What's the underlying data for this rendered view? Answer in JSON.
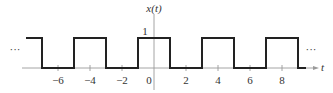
{
  "chart_data": {
    "type": "line",
    "title": "",
    "ylabel": "x(t)",
    "xlabel": "t",
    "xlim": [
      -8.0,
      10.0
    ],
    "ylim": [
      0,
      1
    ],
    "grid": false,
    "x_ticks": [
      -6,
      -4,
      -2,
      0,
      2,
      4,
      6,
      8
    ],
    "x_tick_labels": [
      "−6",
      "−4",
      "−2",
      "0",
      "2",
      "4",
      "6",
      "8"
    ],
    "y_ticks": [
      1
    ],
    "y_tick_labels": [
      "1"
    ],
    "series": [
      {
        "name": "x(t)",
        "description": "periodic square wave, period 4, amplitude 1, high on (-1,1) mod 4",
        "x": [
          -8.0,
          -7,
          -7,
          -5,
          -5,
          -3,
          -3,
          -1,
          -1,
          1,
          1,
          3,
          3,
          5,
          5,
          7,
          7,
          9,
          9,
          9.5
        ],
        "values": [
          1,
          1,
          0,
          0,
          1,
          1,
          0,
          0,
          1,
          1,
          0,
          0,
          1,
          1,
          0,
          0,
          1,
          1,
          0,
          0
        ]
      }
    ],
    "annotations": {
      "left_ellipsis": "···",
      "right_ellipsis": "···"
    }
  }
}
